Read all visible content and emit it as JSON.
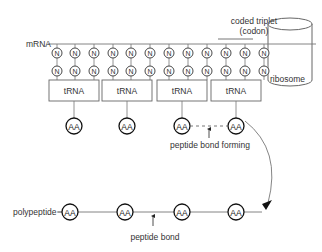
{
  "diagram": {
    "colors": {
      "line": "#7a7a7a",
      "stroke_dark": "#222222",
      "text": "#333333",
      "background": "#ffffff"
    },
    "labels": {
      "mrna": "mRNA",
      "codon_line1": "coded triplet",
      "codon_line2": "(codon)",
      "ribosome": "ribosome",
      "peptide_bond_forming": "peptide bond forming",
      "polypeptide": "polypeptide",
      "peptide_bond": "peptide bond"
    },
    "nucleotide_label": "N",
    "nucleotide_columns": [
      57,
      75,
      94,
      113,
      131,
      150,
      169,
      188,
      207,
      226,
      245,
      264
    ],
    "trna": [
      {
        "label": "tRNA",
        "x": 49,
        "w": 50,
        "aa_x": 74
      },
      {
        "label": "tRNA",
        "x": 102,
        "w": 50,
        "aa_x": 127
      },
      {
        "label": "tRNA",
        "x": 157,
        "w": 50,
        "aa_x": 182
      },
      {
        "label": "tRNA",
        "x": 211,
        "w": 50,
        "aa_x": 236
      }
    ],
    "amino_acid_label": "AA",
    "polypeptide_aa_x": [
      70,
      125,
      182,
      236
    ]
  }
}
